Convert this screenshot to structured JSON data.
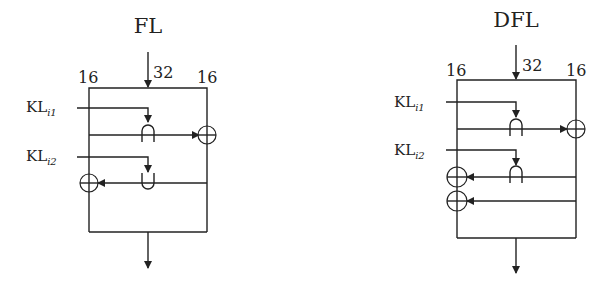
{
  "diagrams": [
    {
      "id": "fl",
      "title": "FL",
      "input_width": "32",
      "left_half_width": "16",
      "right_half_width": "16",
      "key1": {
        "base": "KL",
        "sub": "i1"
      },
      "key2": {
        "base": "KL",
        "sub": "i2"
      },
      "operations": [
        "AND(left, KLi1) -> XOR into right",
        "OR(right, KLi2) -> XOR into left"
      ]
    },
    {
      "id": "dfl",
      "title": "DFL",
      "input_width": "32",
      "left_half_width": "16",
      "right_half_width": "16",
      "key1": {
        "base": "KL",
        "sub": "i1"
      },
      "key2": {
        "base": "KL",
        "sub": "i2"
      },
      "operations": [
        "AND(left, KLi1) -> XOR into right",
        "AND(right, KLi2) -> XOR into left",
        "right -> XOR into left"
      ]
    }
  ]
}
